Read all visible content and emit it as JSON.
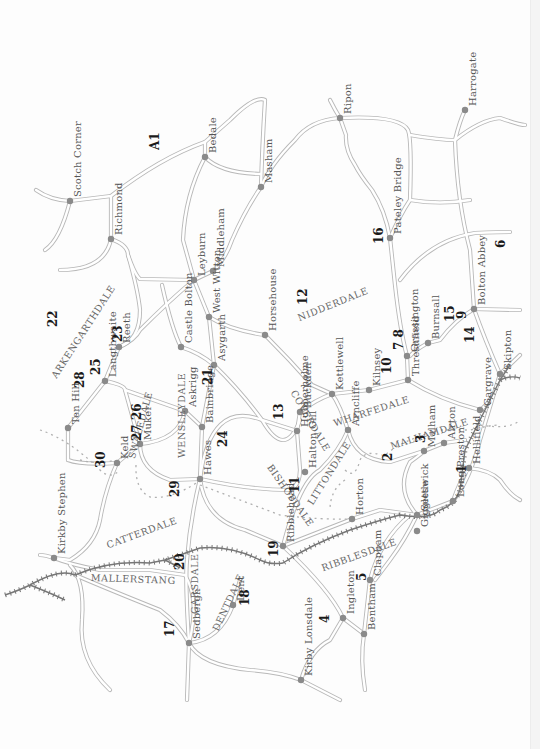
{
  "map": {
    "title": "Yorkshire Dales walks map",
    "road_label": "A1",
    "towns": [
      {
        "name": "Scotch Corner",
        "x": 70,
        "y": 201
      },
      {
        "name": "Richmond",
        "x": 111,
        "y": 239
      },
      {
        "name": "Bedale",
        "x": 205,
        "y": 157
      },
      {
        "name": "Masham",
        "x": 261,
        "y": 187
      },
      {
        "name": "Ripon",
        "x": 340,
        "y": 118
      },
      {
        "name": "Harrogate",
        "x": 465,
        "y": 110
      },
      {
        "name": "Pateley Bridge",
        "x": 390,
        "y": 238
      },
      {
        "name": "Leyburn",
        "x": 194,
        "y": 280
      },
      {
        "name": "Middleham",
        "x": 213,
        "y": 271
      },
      {
        "name": "West Witton",
        "x": 209,
        "y": 317
      },
      {
        "name": "Castle Bolton",
        "x": 181,
        "y": 347
      },
      {
        "name": "Reeth",
        "x": 119,
        "y": 347
      },
      {
        "name": "Langthwaite",
        "x": 105,
        "y": 381
      },
      {
        "name": "Ten Hill",
        "x": 68,
        "y": 428
      },
      {
        "name": "Horsehouse",
        "x": 265,
        "y": 335
      },
      {
        "name": "Asygarth",
        "x": 214,
        "y": 365
      },
      {
        "name": "Askrigg",
        "x": 185,
        "y": 411
      },
      {
        "name": "Bainbridge",
        "x": 202,
        "y": 427
      },
      {
        "name": "Muker",
        "x": 140,
        "y": 444
      },
      {
        "name": "Keld",
        "x": 117,
        "y": 463
      },
      {
        "name": "Hawes",
        "x": 200,
        "y": 479
      },
      {
        "name": "Kettlewell",
        "x": 332,
        "y": 394
      },
      {
        "name": "Kilnsey",
        "x": 369,
        "y": 390
      },
      {
        "name": "Buckden",
        "x": 300,
        "y": 412
      },
      {
        "name": "Hubberholme",
        "x": 297,
        "y": 431
      },
      {
        "name": "Halton Gill",
        "x": 305,
        "y": 472
      },
      {
        "name": "Grassington",
        "x": 407,
        "y": 356
      },
      {
        "name": "Burnsall",
        "x": 428,
        "y": 343
      },
      {
        "name": "Bolton Abbey",
        "x": 474,
        "y": 309
      },
      {
        "name": "Threshfield",
        "x": 408,
        "y": 380
      },
      {
        "name": "Arncliffe",
        "x": 348,
        "y": 430
      },
      {
        "name": "Skipton",
        "x": 500,
        "y": 374
      },
      {
        "name": "Gargrave",
        "x": 480,
        "y": 410
      },
      {
        "name": "Kirkby Stephen",
        "x": 54,
        "y": 558
      },
      {
        "name": "Ribblehead",
        "x": 283,
        "y": 546
      },
      {
        "name": "Horton",
        "x": 352,
        "y": 519
      },
      {
        "name": "Malham",
        "x": 424,
        "y": 451
      },
      {
        "name": "Airton",
        "x": 444,
        "y": 443
      },
      {
        "name": "Hellifield",
        "x": 469,
        "y": 468
      },
      {
        "name": "Settle",
        "x": 417,
        "y": 515
      },
      {
        "name": "Long Preston",
        "x": 453,
        "y": 501
      },
      {
        "name": "Giggleswick",
        "x": 417,
        "y": 531
      },
      {
        "name": "Sedbergh",
        "x": 189,
        "y": 643
      },
      {
        "name": "Dent",
        "x": 233,
        "y": 605
      },
      {
        "name": "Kirby Lonsdale",
        "x": 301,
        "y": 680
      },
      {
        "name": "Ingleton",
        "x": 343,
        "y": 618
      },
      {
        "name": "Clapham",
        "x": 370,
        "y": 580
      },
      {
        "name": "Bentham",
        "x": 364,
        "y": 634
      }
    ],
    "dales": [
      {
        "name": "NIDDERDALE",
        "x": 296,
        "y": 313,
        "rot": -22
      },
      {
        "name": "ARKENGARTHDALE",
        "x": 49,
        "y": 374,
        "rot": -57
      },
      {
        "name": "COVERDALE",
        "x": 298,
        "y": 388,
        "rot": 60
      },
      {
        "name": "BISHOPDALE",
        "x": 274,
        "y": 462,
        "rot": 55
      },
      {
        "name": "WENSLEYDALE",
        "x": 176,
        "y": 458,
        "rot": -90
      },
      {
        "name": "SWALEDALE",
        "x": 126,
        "y": 457,
        "rot": -75
      },
      {
        "name": "WHARFEDALE",
        "x": 332,
        "y": 418,
        "rot": -18
      },
      {
        "name": "LITTONDALE",
        "x": 305,
        "y": 501,
        "rot": -58
      },
      {
        "name": "MALHAMDALE",
        "x": 389,
        "y": 441,
        "rot": -18
      },
      {
        "name": "CATTERDALE",
        "x": 105,
        "y": 540,
        "rot": -20
      },
      {
        "name": "MALLERSTANG",
        "x": 91,
        "y": 572,
        "rot": 2
      },
      {
        "name": "GARSDALE",
        "x": 189,
        "y": 614,
        "rot": -90
      },
      {
        "name": "DENTDALE",
        "x": 210,
        "y": 628,
        "rot": -65
      },
      {
        "name": "RIBBLESDALE",
        "x": 320,
        "y": 563,
        "rot": -20
      }
    ],
    "walk_numbers": [
      {
        "n": "A1",
        "x": 148,
        "y": 150
      },
      {
        "n": "22",
        "x": 46,
        "y": 327
      },
      {
        "n": "23",
        "x": 111,
        "y": 342
      },
      {
        "n": "25",
        "x": 89,
        "y": 375
      },
      {
        "name": "28",
        "n": "28",
        "x": 73,
        "y": 388
      },
      {
        "n": "12",
        "x": 296,
        "y": 305
      },
      {
        "n": "16",
        "x": 372,
        "y": 244
      },
      {
        "n": "6",
        "x": 494,
        "y": 248
      },
      {
        "n": "15",
        "x": 443,
        "y": 322
      },
      {
        "n": "9",
        "x": 455,
        "y": 319
      },
      {
        "n": "7 8",
        "x": 392,
        "y": 350
      },
      {
        "n": "14",
        "x": 463,
        "y": 343
      },
      {
        "n": "10",
        "x": 380,
        "y": 374
      },
      {
        "n": "21",
        "x": 201,
        "y": 385
      },
      {
        "n": "13",
        "x": 272,
        "y": 420
      },
      {
        "n": "24",
        "x": 216,
        "y": 447
      },
      {
        "n": "27 26",
        "x": 130,
        "y": 441
      },
      {
        "n": "30",
        "x": 94,
        "y": 468
      },
      {
        "n": "29",
        "x": 168,
        "y": 497
      },
      {
        "n": "11",
        "x": 288,
        "y": 493
      },
      {
        "n": "2",
        "x": 381,
        "y": 461
      },
      {
        "n": "3",
        "x": 414,
        "y": 443
      },
      {
        "n": "1",
        "x": 455,
        "y": 473
      },
      {
        "n": "19",
        "x": 267,
        "y": 557
      },
      {
        "n": "20",
        "x": 173,
        "y": 570
      },
      {
        "n": "17",
        "x": 163,
        "y": 637
      },
      {
        "n": "18",
        "x": 238,
        "y": 606
      },
      {
        "n": "4",
        "x": 318,
        "y": 623
      },
      {
        "n": "5",
        "x": 355,
        "y": 581
      }
    ]
  }
}
